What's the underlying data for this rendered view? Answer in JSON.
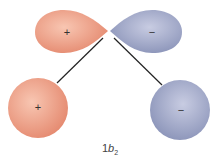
{
  "diagram": {
    "title": "1b2",
    "label_main": "1",
    "label_italic": "b",
    "label_sub": "2",
    "colors": {
      "positive": "#e8917a",
      "positive_light": "#f6c2ae",
      "negative": "#8e97bd",
      "negative_light": "#c3c8e0",
      "bond": "#222222"
    },
    "lobes": [
      {
        "id": "upper-left-lobe",
        "sign": "+",
        "phase": "positive"
      },
      {
        "id": "upper-right-lobe",
        "sign": "−",
        "phase": "negative"
      },
      {
        "id": "lower-left-sphere",
        "sign": "+",
        "phase": "positive"
      },
      {
        "id": "lower-right-sphere",
        "sign": "−",
        "phase": "negative"
      }
    ]
  }
}
